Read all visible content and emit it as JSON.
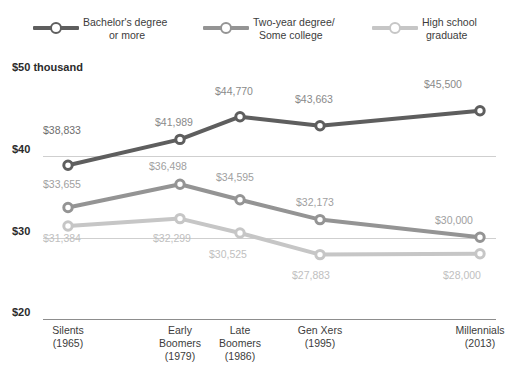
{
  "chart_data": {
    "type": "line",
    "title": "",
    "subtitle": "",
    "xlabel": "",
    "ylabel": "",
    "ylim": [
      20000,
      50000
    ],
    "yticks": [
      "$50 thousand",
      "$40",
      "$30",
      "$20"
    ],
    "ytick_values": [
      50000,
      40000,
      30000,
      20000
    ],
    "grid": true,
    "legend_position": "top",
    "categories": [
      "Silents\n(1965)",
      "Early Boomers\n(1979)",
      "Late Boomers\n(1986)",
      "Gen Xers\n(1995)",
      "Millennials\n(2013)"
    ],
    "series": [
      {
        "name": "Bachelor's degree or more",
        "color": "#5e5e5e",
        "values": [
          38833,
          41989,
          44770,
          43663,
          45500
        ],
        "labels": [
          "$38,833",
          "$41,989",
          "$44,770",
          "$43,663",
          "$45,500"
        ]
      },
      {
        "name": "Two-year degree/Some college",
        "color": "#949494",
        "values": [
          33655,
          36498,
          34595,
          32173,
          30000
        ],
        "labels": [
          "$33,655",
          "$36,498",
          "$34,595",
          "$32,173",
          "$30,000"
        ]
      },
      {
        "name": "High school graduate",
        "color": "#c6c6c6",
        "values": [
          31384,
          32299,
          30525,
          27883,
          28000
        ],
        "labels": [
          "$31,384",
          "$32,299",
          "$30,525",
          "$27,883",
          "$28,000"
        ]
      }
    ]
  },
  "legend": {
    "items": [
      {
        "line1": "Bachelor's degree",
        "line2": "or more",
        "color": "#5e5e5e",
        "marker": "line-circle-marker"
      },
      {
        "line1": "Two-year degree/",
        "line2": "Some college",
        "color": "#949494",
        "marker": "line-circle-marker"
      },
      {
        "line1": "High school",
        "line2": "graduate",
        "color": "#c6c6c6",
        "marker": "line-circle-marker"
      }
    ]
  },
  "yaxis": {
    "t0": "$50 thousand",
    "t1": "$40",
    "t2": "$30",
    "t3": "$20"
  },
  "xaxis": {
    "ticks": [
      {
        "name": "Silents",
        "year": "(1965)"
      },
      {
        "name": "Early",
        "name2": "Boomers",
        "year": "(1979)"
      },
      {
        "name": "Late",
        "name2": "Boomers",
        "year": "(1986)"
      },
      {
        "name": "Gen Xers",
        "year": "(1995)"
      },
      {
        "name": "Millennials",
        "year": "(2013)"
      }
    ]
  },
  "labels": {
    "s0p0": "$38,833",
    "s0p1": "$41,989",
    "s0p2": "$44,770",
    "s0p3": "$43,663",
    "s0p4": "$45,500",
    "s1p0": "$33,655",
    "s1p1": "$36,498",
    "s1p2": "$34,595",
    "s1p3": "$32,173",
    "s1p4": "$30,000",
    "s2p0": "$31,384",
    "s2p1": "$32,299",
    "s2p2": "$30,525",
    "s2p3": "$27,883",
    "s2p4": "$28,000"
  }
}
